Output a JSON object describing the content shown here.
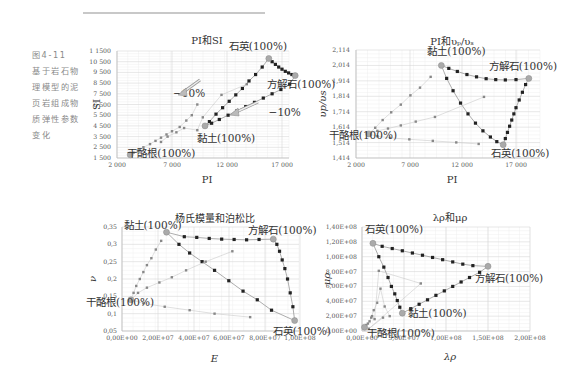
{
  "caption": {
    "figure_number": "图4-11",
    "lines": [
      "基于岩石物",
      "理模型的泥",
      "页岩组成物",
      "质弹性参数",
      "变化"
    ]
  },
  "chart_data": [
    {
      "type": "scatter",
      "title": "PI和SI",
      "xlabel": "PI",
      "ylabel": "SI",
      "x_ticks": [
        "2 000",
        "7 000",
        "12 000",
        "17 000"
      ],
      "y_ticks": [
        "1 1500",
        "10 500",
        "9 500",
        "8 500",
        "7 500",
        "6 500",
        "5 500",
        "4 500",
        "3 500",
        "2 500",
        "1 500"
      ],
      "xlim": [
        2000,
        19000
      ],
      "ylim": [
        1500,
        11500
      ],
      "grid": true,
      "annotations": [
        {
          "text": "石英(100%)",
          "x": 15800,
          "y": 10800
        },
        {
          "text": "方解石(100%)",
          "x": 18200,
          "y": 9200
        },
        {
          "text": "黏土(100%)",
          "x": 10000,
          "y": 4500
        },
        {
          "text": "干酪根(100%)",
          "x": 3200,
          "y": 1800
        },
        {
          "text": "−10%",
          "x": 8000,
          "y": 6300
        },
        {
          "text": "−10%",
          "x": 15600,
          "y": 6200
        }
      ],
      "endmembers": {
        "quartz": [
          15800,
          10800
        ],
        "calcite": [
          18200,
          9200
        ],
        "clay": [
          10000,
          4500
        ],
        "kerogen": [
          3200,
          1800
        ]
      },
      "series": [
        {
          "name": "quartz-calcite",
          "x": [
            15800,
            16100,
            16400,
            16700,
            17000,
            17300,
            17600,
            17900,
            18200
          ],
          "y": [
            10800,
            10500,
            10250,
            10000,
            9800,
            9600,
            9450,
            9300,
            9200
          ]
        },
        {
          "name": "clay-quartz",
          "x": [
            10000,
            10400,
            11000,
            11600,
            12200,
            12800,
            13400,
            14000,
            14600,
            15200,
            15800
          ],
          "y": [
            4500,
            4900,
            5600,
            6200,
            6800,
            7400,
            8000,
            8700,
            9300,
            10000,
            10800
          ]
        },
        {
          "name": "clay-calcite",
          "x": [
            10000,
            10600,
            11300,
            12100,
            12900,
            13700,
            14500,
            15300,
            16100,
            16900,
            17700,
            18200
          ],
          "y": [
            4500,
            4750,
            5100,
            5500,
            5900,
            6300,
            6700,
            7100,
            7500,
            7900,
            8400,
            9200
          ]
        },
        {
          "name": "kerogen-mix",
          "x": [
            3200,
            3500,
            3900,
            4400,
            5000,
            5500,
            6000,
            6500,
            7000,
            7700,
            8300,
            8800,
            9300
          ],
          "y": [
            1800,
            2000,
            2200,
            2500,
            2800,
            3100,
            3400,
            3700,
            4000,
            4400,
            5000,
            5500,
            6500
          ]
        },
        {
          "name": "kerogen-scatter",
          "x": [
            6000,
            6600,
            7400,
            8100,
            9300,
            9800,
            11500,
            13800
          ],
          "y": [
            3000,
            3500,
            3900,
            4300,
            4100,
            5300,
            7400,
            8400
          ]
        }
      ]
    },
    {
      "type": "scatter",
      "title": "PI和vp/vs",
      "title_display": "PI和υₚ/υₛ",
      "xlabel": "PI",
      "ylabel": "υp/υs",
      "x_ticks": [
        "2 000",
        "7 000",
        "12 000",
        "17 000"
      ],
      "y_ticks": [
        "2,114",
        "2,014",
        "1,914",
        "1,814",
        "1,714",
        "1,614",
        "1,514",
        "1,414"
      ],
      "xlim": [
        2000,
        19000
      ],
      "ylim": [
        1.414,
        2.114
      ],
      "grid": true,
      "annotations": [
        {
          "text": "黏土(100%)",
          "x": 10000,
          "y": 2.014
        },
        {
          "text": "方解石(100%)",
          "x": 18200,
          "y": 1.93
        },
        {
          "text": "石英(100%)",
          "x": 15800,
          "y": 1.5
        },
        {
          "text": "干酪根(100%)",
          "x": 3200,
          "y": 1.57
        }
      ],
      "series": [
        {
          "name": "clay-calcite",
          "x": [
            10000,
            10700,
            11500,
            12400,
            13300,
            14200,
            15100,
            16000,
            17000,
            18200
          ],
          "y": [
            2.014,
            1.995,
            1.975,
            1.955,
            1.94,
            1.928,
            1.922,
            1.92,
            1.922,
            1.93
          ]
        },
        {
          "name": "clay-quartz",
          "x": [
            10000,
            10500,
            11100,
            11800,
            12500,
            13200,
            13900,
            14600,
            15200,
            15800
          ],
          "y": [
            2.014,
            1.93,
            1.85,
            1.77,
            1.7,
            1.64,
            1.59,
            1.55,
            1.52,
            1.5
          ]
        },
        {
          "name": "quartz-calcite",
          "x": [
            15800,
            16000,
            16200,
            16400,
            16600,
            16800,
            17000,
            17300,
            17600,
            17900,
            18200
          ],
          "y": [
            1.5,
            1.54,
            1.58,
            1.62,
            1.66,
            1.7,
            1.74,
            1.79,
            1.84,
            1.89,
            1.93
          ]
        },
        {
          "name": "kerogen-clay",
          "x": [
            3200,
            3800,
            4500,
            5300,
            6200,
            7100,
            8000,
            9000
          ],
          "y": [
            1.57,
            1.61,
            1.66,
            1.71,
            1.76,
            1.82,
            1.87,
            1.94
          ]
        },
        {
          "name": "kerogen-calcite",
          "x": [
            3200,
            4000,
            5000,
            6200,
            7600,
            9400,
            14000
          ],
          "y": [
            1.57,
            1.59,
            1.605,
            1.625,
            1.65,
            1.68,
            1.81
          ]
        },
        {
          "name": "kerogen-quartz",
          "x": [
            3200,
            4000,
            5200,
            7000,
            9200,
            11400,
            13500
          ],
          "y": [
            1.57,
            1.555,
            1.545,
            1.535,
            1.525,
            1.515,
            1.505
          ]
        }
      ]
    },
    {
      "type": "scatter",
      "title": "杨氏模量和泊松比",
      "xlabel": "E",
      "ylabel": "ν",
      "x_ticks": [
        "0,00E+00",
        "2,00E+07",
        "4,00E+07",
        "6,00E+07",
        "8,00E+07",
        "1,00E+08"
      ],
      "y_ticks": [
        "0,35",
        "0,3",
        "0,25",
        "0,2",
        "0,15",
        "0,1",
        "0,05"
      ],
      "xlim": [
        0,
        100000000
      ],
      "ylim": [
        0.05,
        0.35
      ],
      "grid": true,
      "annotations": [
        {
          "text": "黏土(100%)",
          "x": 25000000,
          "y": 0.335
        },
        {
          "text": "方解石(100%)",
          "x": 85000000,
          "y": 0.315
        },
        {
          "text": "石英(100%)",
          "x": 97000000,
          "y": 0.08
        },
        {
          "text": "干酪根(100%)",
          "x": 5000000,
          "y": 0.14
        }
      ],
      "series": [
        {
          "name": "clay-calcite",
          "x": [
            25000000,
            35000000,
            42000000,
            49000000,
            56000000,
            63000000,
            70000000,
            77000000,
            85000000
          ],
          "y": [
            0.335,
            0.322,
            0.32,
            0.317,
            0.315,
            0.314,
            0.313,
            0.314,
            0.315
          ]
        },
        {
          "name": "calcite-quartz",
          "x": [
            85000000,
            87000000,
            88500000,
            90000000,
            91500000,
            93000000,
            94500000,
            96000000,
            97000000
          ],
          "y": [
            0.315,
            0.3,
            0.28,
            0.255,
            0.23,
            0.2,
            0.16,
            0.12,
            0.08
          ]
        },
        {
          "name": "clay-quartz",
          "x": [
            25000000,
            32000000,
            38000000,
            45000000,
            52000000,
            60000000,
            68000000,
            76000000,
            84000000,
            97000000
          ],
          "y": [
            0.335,
            0.3,
            0.275,
            0.25,
            0.225,
            0.195,
            0.165,
            0.14,
            0.11,
            0.08
          ]
        },
        {
          "name": "kerogen-clay",
          "x": [
            5000000,
            6500000,
            8000000,
            10000000,
            12000000,
            14000000,
            16500000,
            19000000,
            22000000
          ],
          "y": [
            0.14,
            0.16,
            0.18,
            0.2,
            0.22,
            0.24,
            0.26,
            0.285,
            0.31
          ]
        },
        {
          "name": "kerogen-calcite",
          "x": [
            5000000,
            9000000,
            14000000,
            21000000,
            28000000,
            36000000,
            47000000,
            62000000
          ],
          "y": [
            0.14,
            0.16,
            0.175,
            0.19,
            0.205,
            0.225,
            0.25,
            0.28
          ]
        },
        {
          "name": "kerogen-quartz",
          "x": [
            5000000,
            12000000,
            24000000,
            38000000,
            52000000,
            72000000
          ],
          "y": [
            0.14,
            0.13,
            0.12,
            0.11,
            0.1,
            0.09
          ]
        }
      ]
    },
    {
      "type": "scatter",
      "title": "λρ和μρ",
      "xlabel": "λρ",
      "ylabel": "μρ",
      "x_ticks": [
        "0,00E+00",
        "5,00E+07",
        "1,00E+08",
        "1,50E+08",
        "2,00E+08"
      ],
      "y_ticks": [
        "1,40E+08",
        "1,20E+08",
        "1,00E+08",
        "8,00E+07",
        "6,00E+07",
        "4,00E+07",
        "2,00E+07",
        "0,00E+00"
      ],
      "xlim": [
        0,
        200000000
      ],
      "ylim": [
        0,
        140000000
      ],
      "grid": true,
      "annotations": [
        {
          "text": "石英(100%)",
          "x": 13000000,
          "y": 118000000
        },
        {
          "text": "方解石(100%)",
          "x": 150000000,
          "y": 87000000
        },
        {
          "text": "黏土(100%)",
          "x": 48000000,
          "y": 24000000
        },
        {
          "text": "干酪根(100%)",
          "x": 3000000,
          "y": 5000000
        }
      ],
      "series": [
        {
          "name": "quartz-calcite",
          "x": [
            13000000,
            24000000,
            36000000,
            48000000,
            60000000,
            72000000,
            84000000,
            96000000,
            108000000,
            120000000,
            132000000,
            150000000
          ],
          "y": [
            118000000,
            114000000,
            111000000,
            108000000,
            105000000,
            102000000,
            99000000,
            96000000,
            93000000,
            90000000,
            88000000,
            87000000
          ]
        },
        {
          "name": "quartz-clay",
          "x": [
            13000000,
            20000000,
            26000000,
            31000000,
            35000000,
            39000000,
            42000000,
            45000000,
            48000000
          ],
          "y": [
            118000000,
            100000000,
            86000000,
            72000000,
            60000000,
            50000000,
            41000000,
            32000000,
            24000000
          ]
        },
        {
          "name": "clay-calcite",
          "x": [
            48000000,
            58000000,
            68000000,
            78000000,
            88000000,
            98000000,
            108000000,
            118000000,
            128000000,
            140000000,
            150000000
          ],
          "y": [
            24000000,
            30000000,
            36000000,
            42000000,
            48000000,
            54000000,
            60000000,
            66000000,
            72000000,
            79000000,
            87000000
          ]
        },
        {
          "name": "kerogen-mix",
          "x": [
            3000000,
            5000000,
            7000000,
            9000000,
            11000000,
            14000000,
            18000000,
            22000000,
            27000000,
            33000000
          ],
          "y": [
            5000000,
            8000000,
            10000000,
            13000000,
            18000000,
            28000000,
            38000000,
            57000000,
            33000000,
            20000000
          ]
        },
        {
          "name": "kerogen-scatter",
          "x": [
            12000000,
            15000000,
            20000000,
            70000000,
            8000000,
            25000000
          ],
          "y": [
            20000000,
            16000000,
            81000000,
            64000000,
            3000000,
            18000000
          ]
        }
      ]
    }
  ]
}
